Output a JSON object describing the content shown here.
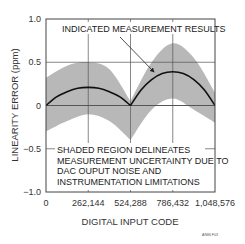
{
  "chart_data": {
    "type": "line",
    "title": "",
    "xlabel": "DIGITAL INPUT CODE",
    "ylabel": "LINEARITY ERROR (ppm)",
    "xlim": [
      0,
      1048576
    ],
    "ylim": [
      -1.0,
      1.0
    ],
    "grid": true,
    "x_ticks": [
      "0",
      "262,144",
      "524,288",
      "786,432",
      "1,048,576"
    ],
    "y_ticks": [
      "1.0",
      "0.5",
      "0",
      "-0.5",
      "-1.0"
    ],
    "series": [
      {
        "name": "Indicated measurement results",
        "x": [
          0,
          65536,
          131072,
          196608,
          262144,
          327680,
          393216,
          458752,
          524288,
          589824,
          655360,
          720896,
          786432,
          851968,
          917504,
          983040,
          1048576
        ],
        "values": [
          0,
          0.1,
          0.16,
          0.2,
          0.21,
          0.2,
          0.16,
          0.1,
          0,
          0.18,
          0.3,
          0.37,
          0.39,
          0.37,
          0.3,
          0.18,
          0
        ]
      },
      {
        "name": "Uncertainty band upper",
        "x": [
          0,
          131072,
          262144,
          393216,
          524288,
          655360,
          786432,
          917504,
          1048576
        ],
        "values": [
          0.32,
          0.46,
          0.5,
          0.42,
          0.05,
          0.5,
          0.72,
          0.55,
          0.15
        ]
      },
      {
        "name": "Uncertainty band lower",
        "x": [
          0,
          131072,
          262144,
          393216,
          524288,
          655360,
          786432,
          917504,
          1048576
        ],
        "values": [
          -0.3,
          -0.18,
          -0.1,
          -0.18,
          -0.4,
          -0.05,
          0.08,
          -0.05,
          -0.2
        ]
      }
    ],
    "annotations": [
      "INDICATED MEASUREMENT RESULTS",
      "SHADED REGION DELINEATES MEASUREMENT UNCERTAINTY DUE TO DAC OUPUT NOISE AND INSTRUMENTATION LIMITATIONS"
    ]
  },
  "labels": {
    "annotation_top": "INDICATED MEASUREMENT RESULTS",
    "annotation_bottom": [
      "SHADED REGION DELINEATES",
      "MEASUREMENT UNCERTAINTY DUE TO",
      "DAC OUPUT NOISE AND",
      "INSTRUMENTATION LIMITATIONS"
    ],
    "footnote": "AN86 F03"
  },
  "colors": {
    "band": "#b8b8b8",
    "curve": "#111111",
    "grid": "#555555"
  }
}
